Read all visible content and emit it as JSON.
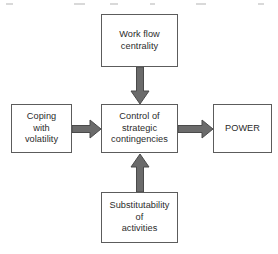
{
  "diagram": {
    "type": "flow-chart",
    "background_color": "#ffffff",
    "box_border_color": "#5c5c5c",
    "arrow_fill_color": "#6b6b6b",
    "arrow_stroke_color": "#4a4a4a",
    "text_color": "#2b2b2b",
    "nodes": [
      {
        "id": "work-flow-centrality",
        "label": "Work flow\ncentrality",
        "x": 101,
        "y": 14,
        "width": 77,
        "height": 53
      },
      {
        "id": "coping-with-volatility",
        "label": "Coping\nwith\nvolatility",
        "x": 11,
        "y": 104,
        "width": 61,
        "height": 49
      },
      {
        "id": "control-of-strategic-contingencies",
        "label": "Control of\nstrategic\ncontingencies",
        "x": 101,
        "y": 104,
        "width": 77,
        "height": 49
      },
      {
        "id": "power",
        "label": "POWER",
        "x": 213,
        "y": 104,
        "width": 59,
        "height": 49
      },
      {
        "id": "substitutability-of-activities",
        "label": "Substitutability\nof\nactivities",
        "x": 101,
        "y": 192,
        "width": 77,
        "height": 51
      }
    ],
    "arrows": [
      {
        "id": "arrow-centrality-to-control",
        "from": "work-flow-centrality",
        "to": "control-of-strategic-contingencies",
        "direction": "down"
      },
      {
        "id": "arrow-coping-to-control",
        "from": "coping-with-volatility",
        "to": "control-of-strategic-contingencies",
        "direction": "right"
      },
      {
        "id": "arrow-control-to-power",
        "from": "control-of-strategic-contingencies",
        "to": "power",
        "direction": "right"
      },
      {
        "id": "arrow-substitutability-to-control",
        "from": "substitutability-of-activities",
        "to": "control-of-strategic-contingencies",
        "direction": "up"
      }
    ]
  }
}
